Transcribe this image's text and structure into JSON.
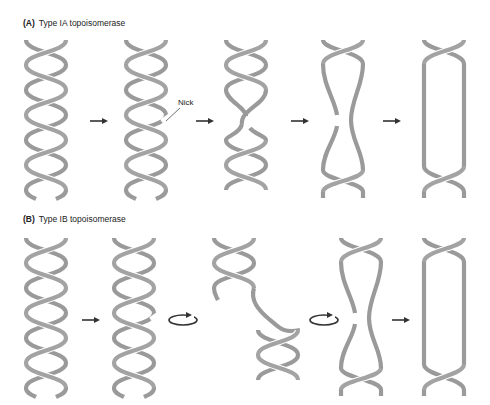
{
  "panels": [
    {
      "id": "A",
      "letter": "(A)",
      "title": "Type IA topoisomerase",
      "steps": [
        "intact double helix",
        "nicked strand",
        "strand passage",
        "nick resealing",
        "relaxed loop"
      ],
      "connectors": [
        "arrow",
        "arrow",
        "arrow",
        "arrow"
      ]
    },
    {
      "id": "B",
      "letter": "(B)",
      "title": "Type IB topoisomerase",
      "steps": [
        "intact double helix",
        "nicked strand",
        "swivel rotation",
        "rotation / resealing",
        "relaxed loop"
      ],
      "connectors": [
        "arrow",
        "rotation",
        "rotation",
        "arrow"
      ]
    }
  ],
  "annotations": {
    "nick_label": "Nick"
  },
  "colors": {
    "strand": "#9a9a9a",
    "arrow": "#333333",
    "background": "#ffffff",
    "text": "#222222"
  }
}
